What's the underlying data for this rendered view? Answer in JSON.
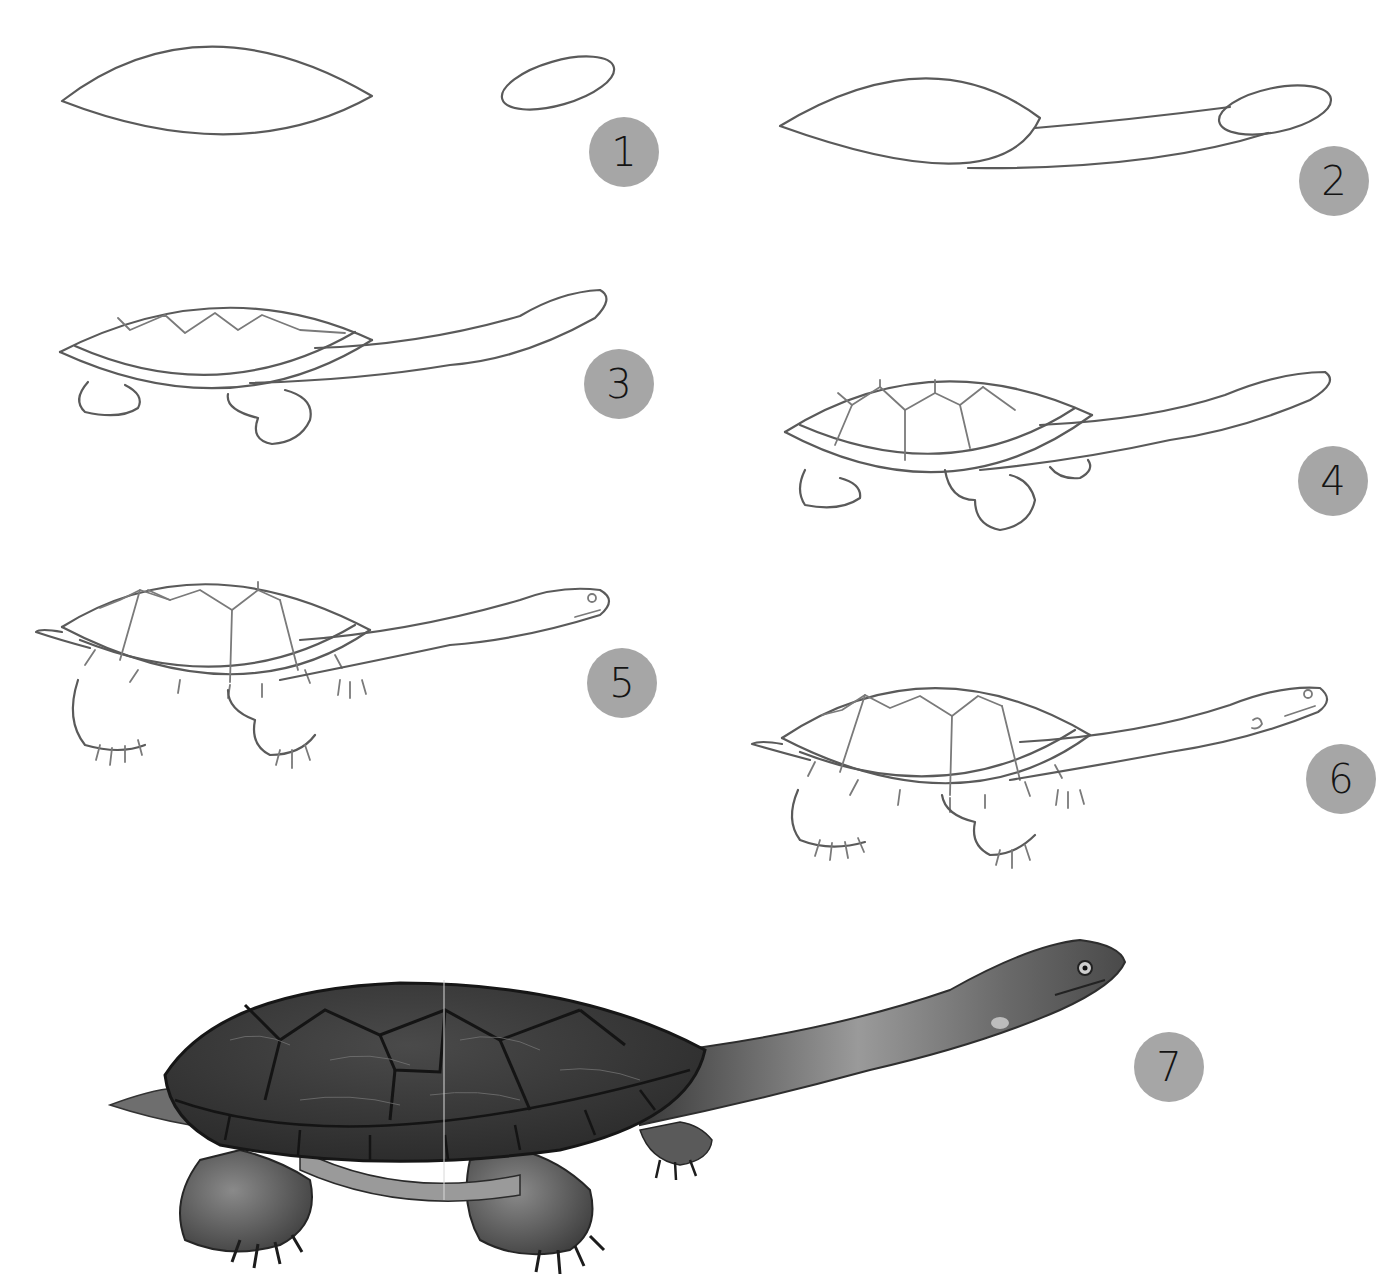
{
  "page": {
    "kind": "step-by-step drawing tutorial"
  },
  "badge_style": {
    "fill": "#a6a6a6",
    "text_color": "#141414"
  },
  "steps": [
    {
      "number": "1",
      "description": "Draw a pointed oval for the shell and a small oval for the head"
    },
    {
      "number": "2",
      "description": "Connect the head to the shell with a long neck"
    },
    {
      "number": "3",
      "description": "Add a zigzag line on the shell, the shell rim and two legs"
    },
    {
      "number": "4",
      "description": "Draw the shell plates and four legs"
    },
    {
      "number": "5",
      "description": "Add rim segments, tail, claws, eye and mouth"
    },
    {
      "number": "6",
      "description": "Refine details and add the ear marking"
    },
    {
      "number": "7",
      "description": "Shade the finished turtle"
    }
  ]
}
